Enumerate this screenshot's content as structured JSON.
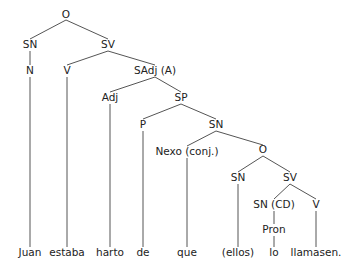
{
  "tree": {
    "nodes": [
      {
        "id": "O1",
        "label": "O",
        "x": 66,
        "y": 18
      },
      {
        "id": "SN1",
        "label": "SN",
        "x": 30,
        "y": 48
      },
      {
        "id": "SV1",
        "label": "SV",
        "x": 108,
        "y": 48
      },
      {
        "id": "N",
        "label": "N",
        "x": 30,
        "y": 74
      },
      {
        "id": "V1",
        "label": "V",
        "x": 67,
        "y": 74
      },
      {
        "id": "SAdj",
        "label": "SAdj (A)",
        "x": 155,
        "y": 74
      },
      {
        "id": "Adj",
        "label": "Adj",
        "x": 110,
        "y": 101
      },
      {
        "id": "SP",
        "label": "SP",
        "x": 181,
        "y": 101
      },
      {
        "id": "P",
        "label": "P",
        "x": 143,
        "y": 128
      },
      {
        "id": "SN2",
        "label": "SN",
        "x": 216,
        "y": 128
      },
      {
        "id": "Nexo",
        "label": "Nexo (conj.)",
        "x": 187,
        "y": 155
      },
      {
        "id": "O2",
        "label": "O",
        "x": 263,
        "y": 153
      },
      {
        "id": "SN3",
        "label": "SN",
        "x": 238,
        "y": 181
      },
      {
        "id": "SV2",
        "label": "SV",
        "x": 290,
        "y": 181
      },
      {
        "id": "SNCD",
        "label": "SN (CD)",
        "x": 274,
        "y": 208
      },
      {
        "id": "V2",
        "label": "V",
        "x": 316,
        "y": 208
      },
      {
        "id": "Pron",
        "label": "Pron",
        "x": 274,
        "y": 233
      }
    ],
    "words": [
      {
        "text": "Juan",
        "x": 30
      },
      {
        "text": "estaba",
        "x": 67
      },
      {
        "text": "harto",
        "x": 110
      },
      {
        "text": "de",
        "x": 143
      },
      {
        "text": "que",
        "x": 187
      },
      {
        "text": "(ellos)",
        "x": 238
      },
      {
        "text": "lo",
        "x": 274
      },
      {
        "text": "llamasen.",
        "x": 316
      }
    ],
    "words_y": 256,
    "edges": [
      [
        66,
        20,
        30,
        39
      ],
      [
        66,
        20,
        108,
        39
      ],
      [
        30,
        51,
        30,
        65
      ],
      [
        108,
        51,
        67,
        65
      ],
      [
        108,
        51,
        155,
        65
      ],
      [
        155,
        77,
        110,
        92
      ],
      [
        155,
        77,
        181,
        92
      ],
      [
        181,
        104,
        143,
        119
      ],
      [
        181,
        104,
        216,
        119
      ],
      [
        216,
        131,
        187,
        146
      ],
      [
        216,
        131,
        263,
        145
      ],
      [
        263,
        156,
        238,
        172
      ],
      [
        263,
        156,
        290,
        172
      ],
      [
        290,
        184,
        274,
        199
      ],
      [
        290,
        184,
        316,
        199
      ],
      [
        30,
        77,
        30,
        247
      ],
      [
        67,
        77,
        67,
        247
      ],
      [
        110,
        104,
        110,
        247
      ],
      [
        143,
        131,
        143,
        247
      ],
      [
        187,
        158,
        187,
        247
      ],
      [
        238,
        184,
        238,
        247
      ],
      [
        274,
        211,
        274,
        224
      ],
      [
        274,
        236,
        274,
        247
      ],
      [
        316,
        211,
        316,
        247
      ]
    ]
  }
}
